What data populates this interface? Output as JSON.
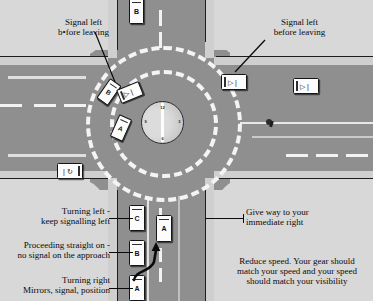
{
  "diagram": {
    "island_label_12": "12",
    "island_label_3": "3",
    "island_label_6": "6",
    "island_label_9": "9"
  },
  "annotations": [
    {
      "id": "signal-left-before-leaving-left",
      "text": "Signal left\nb•fore leaving"
    },
    {
      "id": "signal-left-before-leaving-right",
      "text": "Signal left\nbefore leaving"
    },
    {
      "id": "turning-left",
      "text": "Turning left -\nkeep signalling left"
    },
    {
      "id": "proceeding-straight-on",
      "text": "Proceeding straight on -\nno signal on the approach"
    },
    {
      "id": "turning-right",
      "text": "Turning right\nMirrors, signal, position"
    },
    {
      "id": "give-way",
      "text": "Give way to your\nimmediate right"
    },
    {
      "id": "reduce-speed",
      "text": "Reduce speed. Your gear should\nmatch your speed and your speed\nshould match your visibility"
    }
  ],
  "vehicles": [
    {
      "id": "vehicle-top-b",
      "label": "B",
      "indicator": ""
    },
    {
      "id": "vehicle-circ-b",
      "label": "B",
      "indicator": ""
    },
    {
      "id": "vehicle-circ-arrow",
      "label": "",
      "indicator": "▷ |"
    },
    {
      "id": "vehicle-circ-a",
      "label": "A",
      "indicator": ""
    },
    {
      "id": "vehicle-exit-right-1",
      "label": "",
      "indicator": "▷ |"
    },
    {
      "id": "vehicle-exit-right-2",
      "label": "",
      "indicator": "▷ |"
    },
    {
      "id": "vehicle-left-exit",
      "label": "",
      "indicator": "| ↻"
    },
    {
      "id": "vehicle-queue-c",
      "label": "C",
      "indicator": ""
    },
    {
      "id": "vehicle-queue-b",
      "label": "B",
      "indicator": ""
    },
    {
      "id": "vehicle-queue-a",
      "label": "A",
      "indicator": ""
    },
    {
      "id": "vehicle-right-lane-a",
      "label": "A",
      "indicator": ""
    }
  ],
  "colors": {
    "road": "#8f8f8f",
    "grass": "#d8d8d8",
    "paint": "#f2f2f2",
    "island": "#dcdcdc",
    "ink": "#0a0a0a"
  }
}
